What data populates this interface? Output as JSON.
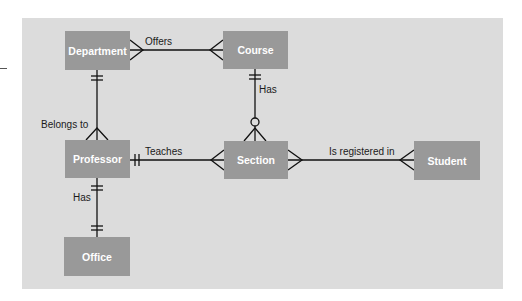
{
  "diagram": {
    "type": "entity-relationship",
    "notation": "crow's foot",
    "colors": {
      "panel": "#dcdcdc",
      "entity_fill": "#999999",
      "entity_text": "#ffffff",
      "line": "#111111"
    },
    "entities": {
      "department": "Department",
      "course": "Course",
      "professor": "Professor",
      "section": "Section",
      "student": "Student",
      "office": "Office"
    },
    "relationships": {
      "offers": "Offers",
      "course_has": "Has",
      "belongs_to": "Belongs to",
      "teaches": "Teaches",
      "is_registered_in": "Is registered in",
      "professor_has": "Has"
    },
    "relationship_list": [
      {
        "from": "Department",
        "to": "Course",
        "label": "Offers",
        "from_card": "many",
        "to_card": "many"
      },
      {
        "from": "Course",
        "to": "Section",
        "label": "Has",
        "from_card": "one and only one",
        "to_card": "zero or many"
      },
      {
        "from": "Department",
        "to": "Professor",
        "label": "Belongs to",
        "from_card": "one and only one",
        "to_card": "many"
      },
      {
        "from": "Professor",
        "to": "Section",
        "label": "Teaches",
        "from_card": "one and only one",
        "to_card": "many"
      },
      {
        "from": "Section",
        "to": "Student",
        "label": "Is registered in",
        "from_card": "many",
        "to_card": "many"
      },
      {
        "from": "Professor",
        "to": "Office",
        "label": "Has",
        "from_card": "one and only one",
        "to_card": "one and only one"
      }
    ]
  }
}
